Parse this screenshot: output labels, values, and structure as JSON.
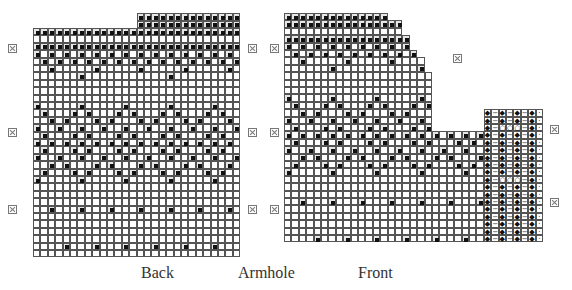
{
  "labels": {
    "back": "Back",
    "armhole": "Armhole",
    "front": "Front"
  },
  "colors": {
    "grid_line": "#555555",
    "contrast_stitch": "#111111",
    "shaded_cell": "#e6e6e6",
    "marker": "#777777"
  },
  "legend_symbols": {
    "filled_square": "contrast-color stitch",
    "diamond": "knit-rib",
    "dash": "purl",
    "circle": "yarn-over",
    "dot": "edge"
  },
  "back_chart": {
    "name": "Back",
    "columns": 28,
    "rows": 31,
    "extension": {
      "start_col": 14,
      "rows": 2
    },
    "markers_left_rows": [
      5,
      16,
      26
    ],
    "markers_right_rows": [
      5,
      16,
      26
    ]
  },
  "front_chart": {
    "name": "Front",
    "body_columns": 27,
    "rib_columns": 8,
    "rib_pattern": [
      "diamond",
      "dash",
      "diamond",
      "dash",
      "diamond",
      "dash",
      "diamond",
      "dot"
    ],
    "rib_eyelet_rows": [
      2,
      9
    ]
  },
  "markers": [
    {
      "side": "back-left",
      "x": 8,
      "y": 44
    },
    {
      "side": "back-left",
      "x": 8,
      "y": 128
    },
    {
      "side": "back-left",
      "x": 8,
      "y": 205
    },
    {
      "side": "back-right",
      "x": 248,
      "y": 44
    },
    {
      "side": "back-right",
      "x": 248,
      "y": 128
    },
    {
      "side": "back-right",
      "x": 248,
      "y": 205
    },
    {
      "side": "front-left",
      "x": 270,
      "y": 44
    },
    {
      "side": "front-left",
      "x": 270,
      "y": 128
    },
    {
      "side": "front-left",
      "x": 270,
      "y": 205
    },
    {
      "side": "front-neck",
      "x": 453,
      "y": 54
    },
    {
      "side": "front-right",
      "x": 550,
      "y": 125
    },
    {
      "side": "front-right",
      "x": 550,
      "y": 198
    }
  ]
}
